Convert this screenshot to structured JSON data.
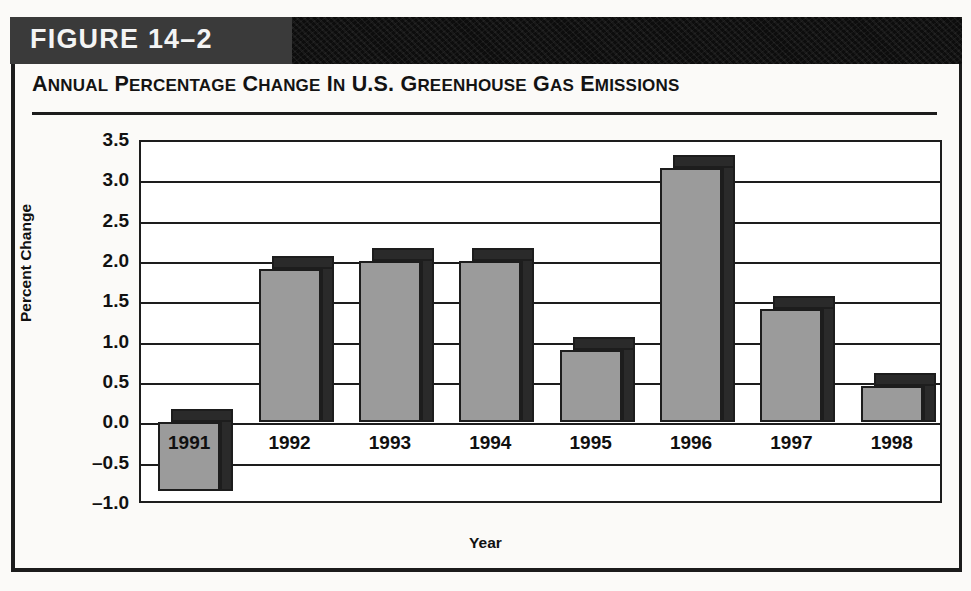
{
  "banner": {
    "figure_label": "FIGURE 14–2"
  },
  "chart_title_parts": {
    "full": "ANNUAL PERCENTAGE CHANGE IN U.S. GREENHOUSE GAS EMISSIONS"
  },
  "axes": {
    "y_title": "Percent Change",
    "x_title": "Year",
    "y_ticks": [
      "3.5",
      "3.0",
      "2.5",
      "2.0",
      "1.5",
      "1.0",
      "0.5",
      "0.0",
      "–0.5",
      "–1.0"
    ]
  },
  "colors": {
    "banner_dark": "#161616",
    "banner_left": "#3a3a3a",
    "bar_face": "#9b9b9b",
    "bar_shadow": "#2a2a2a",
    "outline": "#1d1d1d",
    "page_background": "#fbfaf8"
  },
  "chart_data": {
    "type": "bar",
    "xlabel": "Year",
    "ylabel": "Percent Change",
    "categories": [
      "1991",
      "1992",
      "1993",
      "1994",
      "1995",
      "1996",
      "1997",
      "1998"
    ],
    "values": [
      -0.85,
      1.9,
      2.0,
      2.0,
      0.9,
      3.15,
      1.4,
      0.45
    ],
    "ylim": [
      -1.0,
      3.5
    ],
    "ytick_step": 0.5,
    "grid": true,
    "legend": "none",
    "series_style": "3d-shadowed-bar"
  }
}
